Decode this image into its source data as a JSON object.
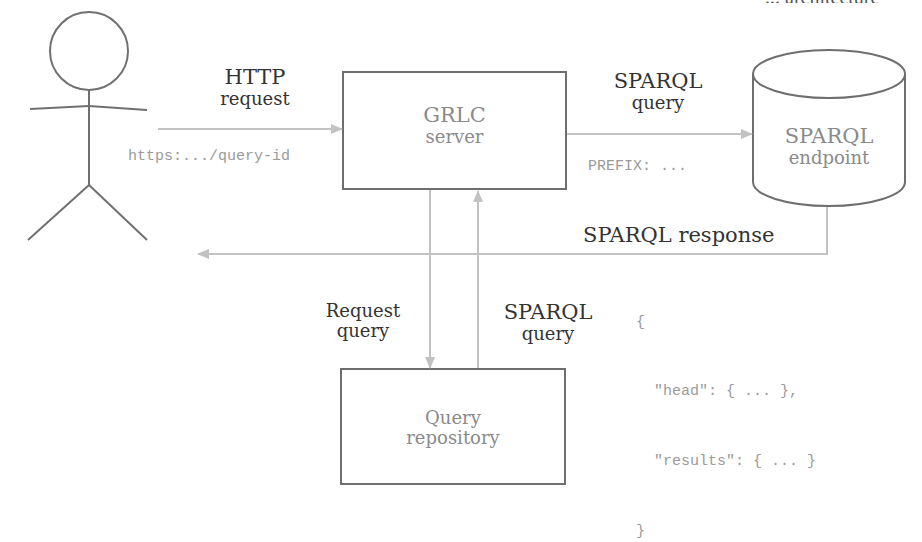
{
  "actor": {
    "name": "user-actor"
  },
  "clipped_header": {
    "text": "... architecture"
  },
  "nodes": {
    "grlc": {
      "line1": "GRLC",
      "line2": "server"
    },
    "endpoint": {
      "line1": "SPARQL",
      "line2": "endpoint"
    },
    "repository": {
      "line1": "Query",
      "line2": "repository"
    }
  },
  "edges": {
    "http_request": {
      "line1": "HTTP",
      "line2": "request",
      "code": "https:.../query-id"
    },
    "sparql_query": {
      "line1": "SPARQL",
      "line2": "query",
      "code": "PREFIX: ..."
    },
    "sparql_response": {
      "label": "SPARQL response"
    },
    "request_query": {
      "line1": "Request",
      "line2": "query"
    },
    "repo_sparql_query": {
      "line1": "SPARQL",
      "line2": "query"
    }
  },
  "response_body": {
    "lines": [
      "{",
      "  \"head\": { ... },",
      "  \"results\": { ... }",
      "}"
    ]
  },
  "colors": {
    "stroke_dark": "#6e6e6e",
    "arrow": "#c2c2c2",
    "label_dark": "#333333",
    "label_light": "#8a8a8a"
  }
}
